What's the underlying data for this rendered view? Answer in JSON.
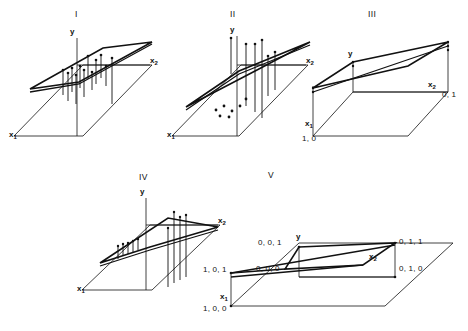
{
  "figure": {
    "background": "#ffffff",
    "ink": "#111111",
    "caption": ""
  },
  "panels": [
    {
      "id": "panel-1",
      "roman": "I",
      "axes": {
        "y": "y",
        "x1": "x",
        "x1_sub": "1",
        "x2": "x",
        "x2_sub": "2"
      },
      "coords": []
    },
    {
      "id": "panel-2",
      "roman": "II",
      "axes": {
        "y": "y",
        "x1": "x",
        "x1_sub": "1",
        "x2": "x",
        "x2_sub": "2"
      },
      "coords": []
    },
    {
      "id": "panel-3",
      "roman": "III",
      "axes": {
        "y": "y",
        "x1": "x",
        "x1_sub": "1",
        "x2": "x",
        "x2_sub": "2"
      },
      "coords": [
        "0, 1",
        "1, 0"
      ]
    },
    {
      "id": "panel-4",
      "roman": "IV",
      "axes": {
        "y": "y",
        "x1": "x",
        "x1_sub": "1",
        "x2": "x",
        "x2_sub": "2"
      },
      "coords": []
    },
    {
      "id": "panel-5",
      "roman": "V",
      "axes": {
        "y": "y",
        "x1": "x",
        "x1_sub": "1",
        "x2": "x",
        "x2_sub": "2"
      },
      "coords": [
        "0, 0, 1",
        "0, 0, 0",
        "0, 1, 1",
        "0, 1, 0",
        "1, 0, 1",
        "1, 0, 0",
        "1",
        "0"
      ]
    }
  ],
  "labels": {
    "p1_roman": "I",
    "p1_y": "y",
    "p1_x1": "x",
    "p1_x1s": "1",
    "p1_x2": "x",
    "p1_x2s": "2",
    "p2_roman": "II",
    "p2_y": "y",
    "p2_x1": "x",
    "p2_x1s": "1",
    "p2_x2": "x",
    "p2_x2s": "2",
    "p3_roman": "III",
    "p3_y": "y",
    "p3_x1": "x",
    "p3_x1s": "1",
    "p3_x2": "x",
    "p3_x2s": "2",
    "p3_c01": "0, 1",
    "p3_c10": "1, 0",
    "p4_roman": "IV",
    "p4_y": "y",
    "p4_x1": "x",
    "p4_x1s": "1",
    "p4_x2": "x",
    "p4_x2s": "2",
    "p5_roman": "V",
    "p5_y": "y",
    "p5_x1": "x",
    "p5_x1s": "1",
    "p5_x2": "x",
    "p5_x2s": "2",
    "p5_001": "0, 0, 1",
    "p5_000": "0, 0, 0",
    "p5_011": "0, 1, 1",
    "p5_010": "0, 1, 0",
    "p5_101": "1, 0, 1",
    "p5_100": "1, 0, 0",
    "p5_one": "1",
    "p5_zero": "0"
  }
}
